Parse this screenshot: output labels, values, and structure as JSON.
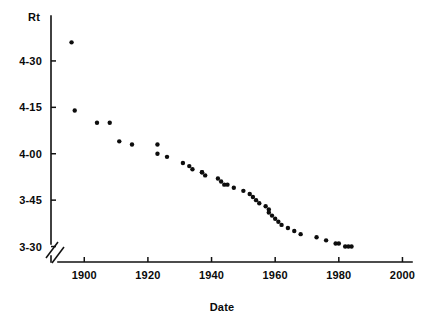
{
  "chart_data": {
    "type": "scatter",
    "title": "",
    "xlabel": "Date",
    "ylabel": "Rt",
    "xlim": [
      1893,
      2003
    ],
    "ylim_seconds": [
      205,
      280
    ],
    "xticks": [
      1900,
      1920,
      1940,
      1960,
      1980,
      2000
    ],
    "xtick_labels": [
      "1900",
      "1920",
      "1940",
      "1960",
      "1980",
      "2000"
    ],
    "yticks_seconds": [
      270,
      255,
      240,
      225,
      210
    ],
    "ytick_labels": [
      "4-30",
      "4-15",
      "4-00",
      "3-45",
      "3-30"
    ],
    "grid": false,
    "legend": null,
    "axis_break": true,
    "marker": "filled-circle",
    "marker_color": "#0d0d0d",
    "points": [
      {
        "x": 1896,
        "y": "4-36",
        "y_seconds": 276.0
      },
      {
        "x": 1897,
        "y": "4-14",
        "y_seconds": 254.0
      },
      {
        "x": 1904,
        "y": "4-10",
        "y_seconds": 250.0
      },
      {
        "x": 1908,
        "y": "4-10",
        "y_seconds": 250.0
      },
      {
        "x": 1911,
        "y": "4-04",
        "y_seconds": 244.0
      },
      {
        "x": 1915,
        "y": "4-03",
        "y_seconds": 243.0
      },
      {
        "x": 1923,
        "y": "4-03",
        "y_seconds": 243.0
      },
      {
        "x": 1923,
        "y": "4-00",
        "y_seconds": 240.0
      },
      {
        "x": 1926,
        "y": "3-59",
        "y_seconds": 239.0
      },
      {
        "x": 1931,
        "y": "3-57",
        "y_seconds": 237.0
      },
      {
        "x": 1933,
        "y": "3-56",
        "y_seconds": 236.0
      },
      {
        "x": 1934,
        "y": "3-55",
        "y_seconds": 235.0
      },
      {
        "x": 1937,
        "y": "3-54",
        "y_seconds": 234.0
      },
      {
        "x": 1937,
        "y": "3-54",
        "y_seconds": 234.0
      },
      {
        "x": 1938,
        "y": "3-53",
        "y_seconds": 233.0
      },
      {
        "x": 1942,
        "y": "3-52",
        "y_seconds": 232.0
      },
      {
        "x": 1943,
        "y": "3-51",
        "y_seconds": 231.0
      },
      {
        "x": 1944,
        "y": "3-50",
        "y_seconds": 230.0
      },
      {
        "x": 1945,
        "y": "3-50",
        "y_seconds": 230.0
      },
      {
        "x": 1947,
        "y": "3-49",
        "y_seconds": 229.0
      },
      {
        "x": 1950,
        "y": "3-48",
        "y_seconds": 228.0
      },
      {
        "x": 1952,
        "y": "3-47",
        "y_seconds": 227.0
      },
      {
        "x": 1953,
        "y": "3-46",
        "y_seconds": 226.0
      },
      {
        "x": 1954,
        "y": "3-45",
        "y_seconds": 225.0
      },
      {
        "x": 1955,
        "y": "3-44",
        "y_seconds": 224.0
      },
      {
        "x": 1957,
        "y": "3-43",
        "y_seconds": 223.0
      },
      {
        "x": 1958,
        "y": "3-42",
        "y_seconds": 222.0
      },
      {
        "x": 1958,
        "y": "3-41",
        "y_seconds": 221.0
      },
      {
        "x": 1959,
        "y": "3-40",
        "y_seconds": 220.0
      },
      {
        "x": 1960,
        "y": "3-39",
        "y_seconds": 219.0
      },
      {
        "x": 1961,
        "y": "3-38",
        "y_seconds": 218.0
      },
      {
        "x": 1962,
        "y": "3-37",
        "y_seconds": 217.0
      },
      {
        "x": 1964,
        "y": "3-36",
        "y_seconds": 216.0
      },
      {
        "x": 1966,
        "y": "3-35",
        "y_seconds": 215.0
      },
      {
        "x": 1968,
        "y": "3-34",
        "y_seconds": 214.0
      },
      {
        "x": 1973,
        "y": "3-33",
        "y_seconds": 213.0
      },
      {
        "x": 1976,
        "y": "3-32",
        "y_seconds": 212.0
      },
      {
        "x": 1979,
        "y": "3-31",
        "y_seconds": 211.0
      },
      {
        "x": 1980,
        "y": "3-31",
        "y_seconds": 211.0
      },
      {
        "x": 1982,
        "y": "3-30",
        "y_seconds": 210.0
      },
      {
        "x": 1983,
        "y": "3-30",
        "y_seconds": 210.0
      },
      {
        "x": 1984,
        "y": "3-30",
        "y_seconds": 210.0
      }
    ]
  }
}
